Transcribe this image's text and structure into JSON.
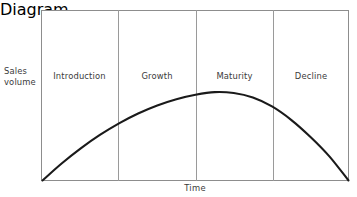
{
  "figure": {
    "title": "",
    "y_axis_label_lines": [
      "Sales",
      "volume"
    ],
    "x_axis_label": "Time",
    "stages": [
      {
        "label": "Introduction"
      },
      {
        "label": "Growth"
      },
      {
        "label": "Maturity"
      },
      {
        "label": "Decline"
      }
    ],
    "colors": {
      "frame": "#8d8d8d",
      "divider": "#9a9a9a",
      "curve": "#1a1a1a",
      "text": "#3a3a3a",
      "background": "#ffffff"
    }
  },
  "chart_data": {
    "type": "line",
    "title": "",
    "xlabel": "Time",
    "ylabel": "Sales volume",
    "grid": false,
    "legend_position": "none",
    "xlim": [
      0,
      4
    ],
    "ylim": [
      0,
      1
    ],
    "axis_ticks": {
      "x": [],
      "y": []
    },
    "annotations": [
      "Introduction",
      "Growth",
      "Maturity",
      "Decline"
    ],
    "stage_boundaries": [
      0,
      1,
      2,
      3,
      4
    ],
    "series": [
      {
        "name": "Sales volume",
        "x": [
          0.0,
          0.25,
          0.5,
          0.75,
          1.0,
          1.25,
          1.5,
          1.75,
          2.0,
          2.25,
          2.5,
          2.75,
          3.0,
          3.25,
          3.5,
          3.75,
          4.0
        ],
        "values": [
          0.0,
          0.19,
          0.36,
          0.51,
          0.64,
          0.75,
          0.84,
          0.91,
          0.96,
          0.99,
          0.98,
          0.93,
          0.83,
          0.68,
          0.49,
          0.27,
          0.0
        ]
      }
    ]
  }
}
